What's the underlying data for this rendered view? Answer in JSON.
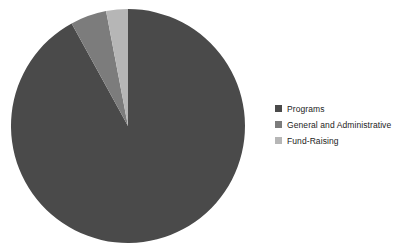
{
  "chart_data": {
    "type": "pie",
    "title": "",
    "categories": [
      "Programs",
      "General and Administrative",
      "Fund-Raising"
    ],
    "values": [
      92,
      5,
      3
    ],
    "unit": "percent",
    "colors": [
      "#4a4a4a",
      "#7c7c7c",
      "#b6b6b6"
    ],
    "start_angle_deg": 0,
    "direction": "clockwise",
    "legend_position": "right",
    "grid": false,
    "labels_shown": false,
    "background": "#ffffff"
  },
  "legend": {
    "items": [
      {
        "label": "Programs",
        "color": "#4a4a4a",
        "value": 92
      },
      {
        "label": "General and Administrative",
        "color": "#7c7c7c",
        "value": 5
      },
      {
        "label": "Fund-Raising",
        "color": "#b6b6b6",
        "value": 3
      }
    ]
  },
  "pie": {
    "center_x": 128,
    "center_y": 126,
    "radius": 117,
    "slices": [
      {
        "name": "Programs",
        "color": "#4a4a4a",
        "start_deg": 0,
        "end_deg": 331.2
      },
      {
        "name": "General and Administrative",
        "color": "#7c7c7c",
        "start_deg": 331.2,
        "end_deg": 349.2
      },
      {
        "name": "Fund-Raising",
        "color": "#b6b6b6",
        "start_deg": 349.2,
        "end_deg": 360
      }
    ]
  }
}
